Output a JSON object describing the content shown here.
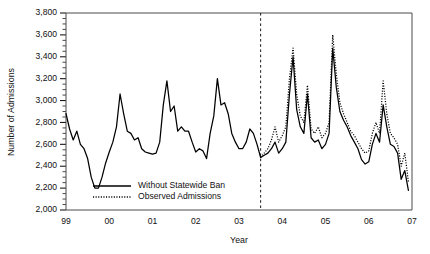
{
  "chart_data": {
    "type": "line",
    "title": "",
    "xlabel": "Year",
    "ylabel": "Number of Admissions",
    "grid": false,
    "legend_position": "inner-lower-left",
    "xlim": [
      1999.0,
      2007.0
    ],
    "ylim": [
      2000,
      3800
    ],
    "y_ticks": [
      2000,
      2200,
      2400,
      2600,
      2800,
      3000,
      3200,
      3400,
      3600,
      3800
    ],
    "y_tick_labels": [
      "2,000",
      "2,200",
      "2,400",
      "2,600",
      "2,800",
      "3,000",
      "3,200",
      "3,400",
      "3,600",
      "3,800"
    ],
    "y_minor_tick_step": 50,
    "x_ticks": [
      1999,
      2000,
      2001,
      2002,
      2003,
      2004,
      2005,
      2006,
      2007
    ],
    "x_tick_labels": [
      "99",
      "00",
      "01",
      "02",
      "03",
      "04",
      "05",
      "06",
      "07"
    ],
    "annotations": [
      {
        "name": "intervention-line",
        "type": "vline",
        "x": 2003.5,
        "style": "dashed"
      }
    ],
    "series": [
      {
        "name": "Without Statewide Ban",
        "style": "solid",
        "x": [
          1999.0,
          1999.083,
          1999.167,
          1999.25,
          1999.333,
          1999.417,
          1999.5,
          1999.583,
          1999.667,
          1999.75,
          1999.833,
          1999.917,
          2000.0,
          2000.083,
          2000.167,
          2000.25,
          2000.333,
          2000.417,
          2000.5,
          2000.583,
          2000.667,
          2000.75,
          2000.833,
          2000.917,
          2001.0,
          2001.083,
          2001.167,
          2001.25,
          2001.333,
          2001.417,
          2001.5,
          2001.583,
          2001.667,
          2001.75,
          2001.833,
          2001.917,
          2002.0,
          2002.083,
          2002.167,
          2002.25,
          2002.333,
          2002.417,
          2002.5,
          2002.583,
          2002.667,
          2002.75,
          2002.833,
          2002.917,
          2003.0,
          2003.083,
          2003.167,
          2003.25,
          2003.333,
          2003.417,
          2003.5,
          2003.583,
          2003.667,
          2003.75,
          2003.833,
          2003.917,
          2004.0,
          2004.083,
          2004.167,
          2004.25,
          2004.333,
          2004.417,
          2004.5,
          2004.583,
          2004.667,
          2004.75,
          2004.833,
          2004.917,
          2005.0,
          2005.083,
          2005.167,
          2005.25,
          2005.333,
          2005.417,
          2005.5,
          2005.583,
          2005.667,
          2005.75,
          2005.833,
          2005.917,
          2006.0,
          2006.083,
          2006.167,
          2006.25,
          2006.333,
          2006.417,
          2006.5,
          2006.583,
          2006.667,
          2006.75,
          2006.833,
          2006.917
        ],
        "values": [
          2880,
          2740,
          2640,
          2720,
          2600,
          2560,
          2470,
          2300,
          2200,
          2200,
          2300,
          2430,
          2530,
          2620,
          2760,
          3060,
          2880,
          2720,
          2700,
          2640,
          2660,
          2560,
          2530,
          2520,
          2510,
          2520,
          2620,
          2960,
          3180,
          2900,
          2950,
          2720,
          2760,
          2720,
          2720,
          2620,
          2530,
          2560,
          2540,
          2470,
          2700,
          2860,
          3200,
          2960,
          2980,
          2880,
          2700,
          2620,
          2560,
          2560,
          2620,
          2740,
          2700,
          2600,
          2480,
          2500,
          2520,
          2560,
          2620,
          2520,
          2560,
          2620,
          3060,
          3400,
          2920,
          2760,
          2700,
          3060,
          2660,
          2620,
          2640,
          2560,
          2600,
          2700,
          3480,
          3120,
          2900,
          2820,
          2760,
          2680,
          2620,
          2560,
          2460,
          2420,
          2440,
          2600,
          2700,
          2620,
          2960,
          2760,
          2600,
          2580,
          2520,
          2280,
          2360,
          2180
        ]
      },
      {
        "name": "Observed Admissions",
        "style": "dotted",
        "x": [
          2003.5,
          2003.583,
          2003.667,
          2003.75,
          2003.833,
          2003.917,
          2004.0,
          2004.083,
          2004.167,
          2004.25,
          2004.333,
          2004.417,
          2004.5,
          2004.583,
          2004.667,
          2004.75,
          2004.833,
          2004.917,
          2005.0,
          2005.083,
          2005.167,
          2005.25,
          2005.333,
          2005.417,
          2005.5,
          2005.583,
          2005.667,
          2005.75,
          2005.833,
          2005.917,
          2006.0,
          2006.083,
          2006.167,
          2006.25,
          2006.333,
          2006.417,
          2006.5,
          2006.583,
          2006.667,
          2006.75,
          2006.833,
          2006.917
        ],
        "values": [
          2480,
          2520,
          2560,
          2640,
          2760,
          2620,
          2680,
          2760,
          3200,
          3480,
          3060,
          2860,
          2800,
          3140,
          2740,
          2700,
          2760,
          2660,
          2700,
          2800,
          3600,
          3240,
          2980,
          2880,
          2800,
          2720,
          2680,
          2620,
          2560,
          2520,
          2540,
          2700,
          2800,
          2700,
          3180,
          2880,
          2700,
          2660,
          2600,
          2400,
          2520,
          2260
        ]
      }
    ]
  },
  "legend": {
    "items": [
      {
        "label": "Without Statewide Ban",
        "style": "solid"
      },
      {
        "label": "Observed Admissions",
        "style": "dotted"
      }
    ]
  }
}
